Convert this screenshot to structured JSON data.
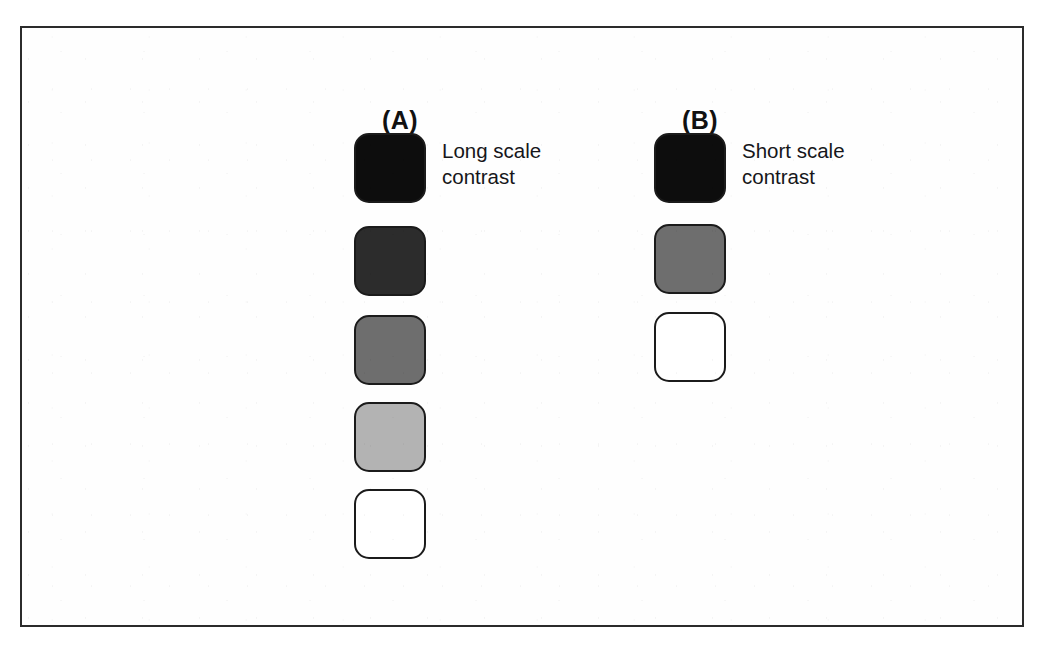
{
  "figure": {
    "background_color": "#ffffff",
    "frame_border_color": "#2b2b2b",
    "swatch_outline_color": "#1b1b1b"
  },
  "panels": [
    {
      "label": "(A)",
      "caption": "Long scale\ncontrast",
      "swatch_count": 5,
      "swatches": [
        {
          "name": "swatch-a-1",
          "tone": "black",
          "color": "#0d0d0d",
          "step": 1
        },
        {
          "name": "swatch-a-2",
          "tone": "dark-gray",
          "color": "#2c2c2c",
          "step": 2
        },
        {
          "name": "swatch-a-3",
          "tone": "mid-gray",
          "color": "#6e6e6e",
          "step": 3
        },
        {
          "name": "swatch-a-4",
          "tone": "light-gray",
          "color": "#b3b3b3",
          "step": 4
        },
        {
          "name": "swatch-a-5",
          "tone": "white",
          "color": "#ffffff",
          "step": 5
        }
      ]
    },
    {
      "label": "(B)",
      "caption": "Short scale\ncontrast",
      "swatch_count": 3,
      "swatches": [
        {
          "name": "swatch-b-1",
          "tone": "black",
          "color": "#0d0d0d",
          "step": 1
        },
        {
          "name": "swatch-b-2",
          "tone": "mid-gray",
          "color": "#6e6e6e",
          "step": 2
        },
        {
          "name": "swatch-b-3",
          "tone": "white",
          "color": "#ffffff",
          "step": 3
        }
      ]
    }
  ]
}
